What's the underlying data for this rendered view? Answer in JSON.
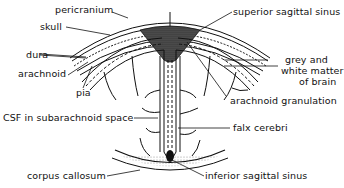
{
  "diagram": {
    "labels": {
      "pericranium": "pericranium",
      "skull": "skull",
      "dura": "dura",
      "arachnoid": "arachnoid",
      "pia": "pia",
      "csf": "CSF in subarachnoid space",
      "corpus_callosum": "corpus callosum",
      "superior_sagittal_sinus": "superior sagittal sinus",
      "grey_white_1": "grey and",
      "grey_white_2": "white matter",
      "grey_white_3": "of brain",
      "arachnoid_granulation": "arachnoid granulation",
      "falx_cerebri": "falx cerebri",
      "inferior_sagittal_sinus": "inferior sagittal sinus"
    },
    "colors": {
      "ink": "#111111",
      "background": "#ffffff"
    }
  }
}
